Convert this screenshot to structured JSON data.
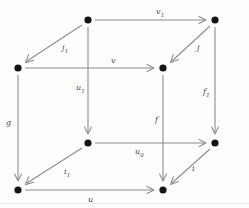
{
  "diagram": {
    "kind": "commutative-cube",
    "title": "",
    "stroke_color": "#8c8c8c",
    "vertex_color": "#141414",
    "label_color": "#4a4a4a",
    "background": "#fdfdfd",
    "vertices": [
      {
        "id": "back-top-left",
        "x": 88,
        "y": 20,
        "label": ""
      },
      {
        "id": "back-top-right",
        "x": 215,
        "y": 20,
        "label": ""
      },
      {
        "id": "front-top-left",
        "x": 18,
        "y": 68,
        "label": ""
      },
      {
        "id": "front-top-right",
        "x": 163,
        "y": 68,
        "label": ""
      },
      {
        "id": "back-bottom-left",
        "x": 88,
        "y": 143,
        "label": ""
      },
      {
        "id": "back-bottom-right",
        "x": 215,
        "y": 143,
        "label": ""
      },
      {
        "id": "front-bottom-left",
        "x": 18,
        "y": 190,
        "label": ""
      },
      {
        "id": "front-bottom-right",
        "x": 163,
        "y": 190,
        "label": ""
      }
    ],
    "edges": [
      {
        "id": "v1",
        "from": "back-top-left",
        "to": "back-top-right",
        "base": "v",
        "sub": "1",
        "lx": 156,
        "ly": 8
      },
      {
        "id": "j",
        "from": "back-top-right",
        "to": "front-top-right",
        "base": "j",
        "sub": "",
        "lx": 197,
        "ly": 44
      },
      {
        "id": "j1",
        "from": "back-top-left",
        "to": "front-top-left",
        "base": "j",
        "sub": "1",
        "lx": 62,
        "ly": 44
      },
      {
        "id": "v",
        "from": "front-top-left",
        "to": "front-top-right",
        "base": "v",
        "sub": "",
        "lx": 111,
        "ly": 57
      },
      {
        "id": "u1",
        "from": "back-top-left",
        "to": "back-bottom-left",
        "base": "u",
        "sub": "1",
        "lx": 76,
        "ly": 84
      },
      {
        "id": "g",
        "from": "front-top-left",
        "to": "front-bottom-left",
        "base": "g",
        "sub": "",
        "lx": 6,
        "ly": 119
      },
      {
        "id": "f1",
        "from": "back-top-right",
        "to": "back-bottom-right",
        "base": "f",
        "sub": "1",
        "lx": 203,
        "ly": 88
      },
      {
        "id": "f",
        "from": "front-top-right",
        "to": "front-bottom-right",
        "base": "f",
        "sub": "",
        "lx": 155,
        "ly": 116
      },
      {
        "id": "u0",
        "from": "back-bottom-left",
        "to": "back-bottom-right",
        "base": "u",
        "sub": "0",
        "lx": 135,
        "ly": 148
      },
      {
        "id": "i1",
        "from": "back-bottom-left",
        "to": "front-bottom-left",
        "base": "i",
        "sub": "1",
        "lx": 64,
        "ly": 168
      },
      {
        "id": "i",
        "from": "back-bottom-right",
        "to": "front-bottom-right",
        "base": "i",
        "sub": "",
        "lx": 192,
        "ly": 165
      },
      {
        "id": "u",
        "from": "front-bottom-left",
        "to": "front-bottom-right",
        "base": "u",
        "sub": "",
        "lx": 88,
        "ly": 196
      }
    ]
  }
}
